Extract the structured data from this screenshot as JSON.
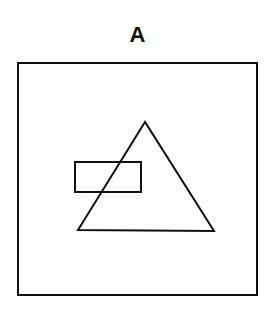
{
  "figure": {
    "label": "A",
    "stroke_color": "#111111",
    "outer_square": {
      "x": 18,
      "y": 63,
      "width": 239,
      "height": 232
    },
    "triangle": {
      "points": "145,122 78,230 214,231"
    },
    "rectangle": {
      "x": 75,
      "y": 162,
      "width": 66,
      "height": 30
    }
  }
}
